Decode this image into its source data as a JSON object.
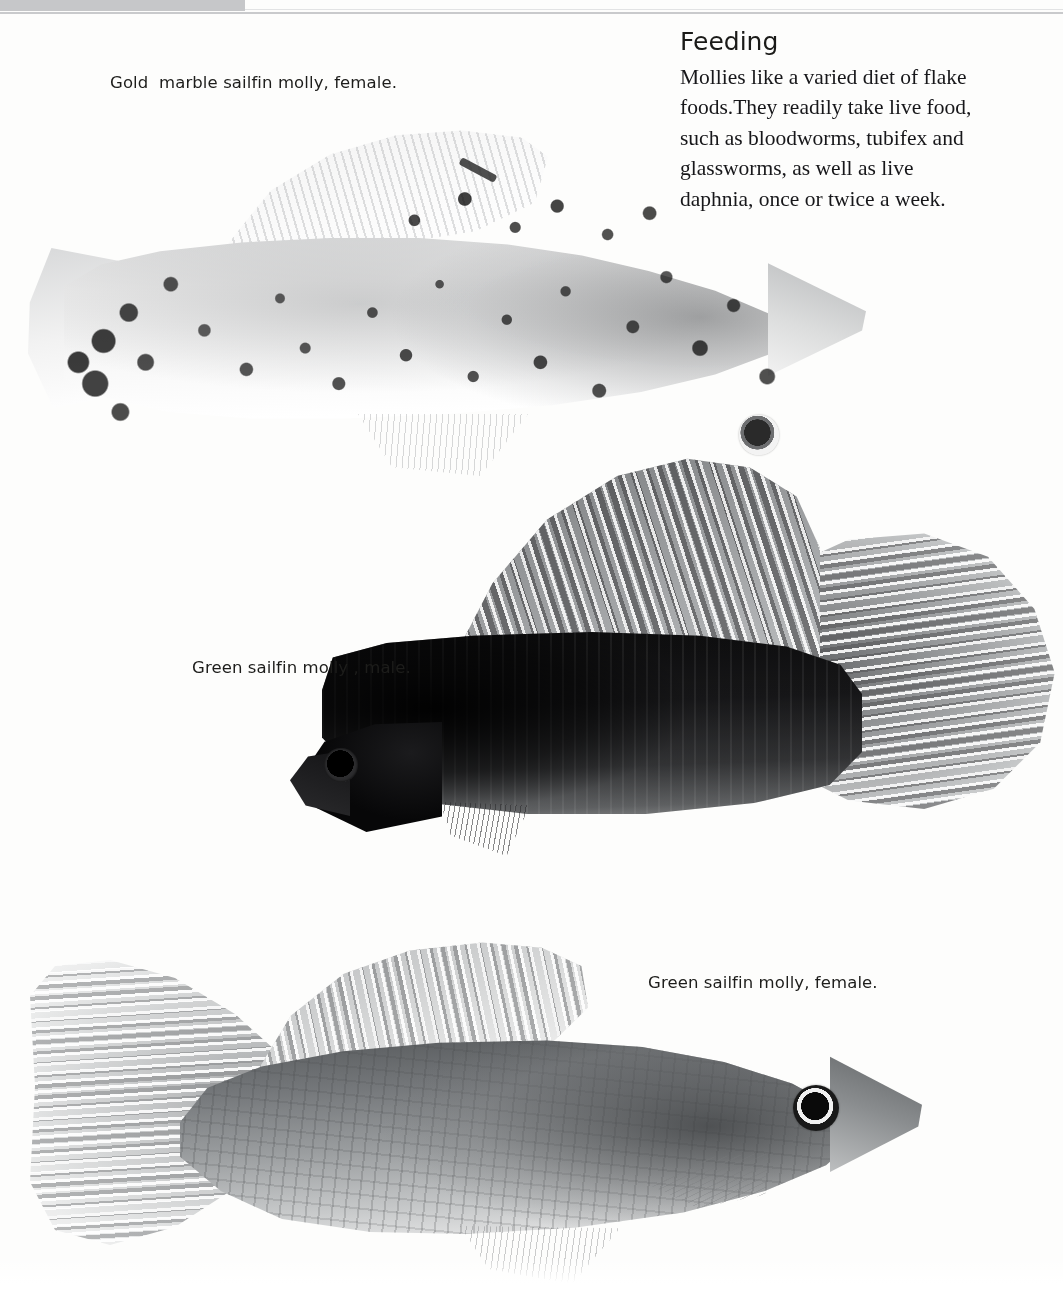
{
  "page": {
    "background_color": "#fdfdfc",
    "top_trim_color": "#c6c7c9"
  },
  "captions": [
    {
      "id": "caption-1",
      "text": "Gold  marble sailfin molly, female."
    },
    {
      "id": "caption-2",
      "text": "Green sailfin molly , male."
    },
    {
      "id": "caption-3",
      "text": "Green sailfin molly, female."
    }
  ],
  "feeding": {
    "heading": "Feeding",
    "lines": [
      "Mollies like a varied diet of flake",
      "foods.They readily take live food,",
      "such as bloodworms, tubifex and",
      "glassworms, as well as live",
      "daphnia, once or twice a week."
    ]
  },
  "figures": [
    {
      "name": "gold-marble-sailfin-molly-female",
      "species": "Gold marble sailfin molly",
      "sex": "female",
      "description": "Pale cream fish with heavy dark-brown/black marbled speckling over the body, large rounded dorsal sailfin, dark-ringed eye, facing right."
    },
    {
      "name": "green-sailfin-molly-male",
      "species": "Green sailfin molly",
      "sex": "male",
      "description": "Very dark near-black body with a tall spotted sailfin dorsal and a large rounded spotted caudal fin, facing left."
    },
    {
      "name": "green-sailfin-molly-female",
      "species": "Green sailfin molly",
      "sex": "female",
      "description": "Mid-grey olive body with rows of scale spots, pale fan-shaped caudal fin and spotted dorsal fin, facing right."
    }
  ]
}
